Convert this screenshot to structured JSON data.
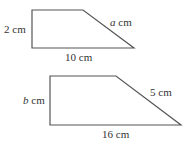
{
  "shapes": [
    {
      "name": "trapezoid-1",
      "points": [
        [
          32,
          10
        ],
        [
          83,
          10
        ],
        [
          134,
          48
        ],
        [
          32,
          48
        ]
      ],
      "labels": {
        "height": {
          "var": "",
          "text": "2 cm"
        },
        "slant": {
          "var": "a",
          "text": " cm"
        },
        "base": {
          "var": "",
          "text": "10 cm"
        }
      }
    },
    {
      "name": "trapezoid-2",
      "points": [
        [
          50,
          76
        ],
        [
          116,
          76
        ],
        [
          181,
          125
        ],
        [
          50,
          125
        ]
      ],
      "labels": {
        "height": {
          "var": "b",
          "text": " cm"
        },
        "slant": {
          "var": "",
          "text": "5 cm"
        },
        "base": {
          "var": "",
          "text": "16 cm"
        }
      }
    }
  ],
  "colors": {
    "stroke": "#555555",
    "text": "#333333"
  }
}
